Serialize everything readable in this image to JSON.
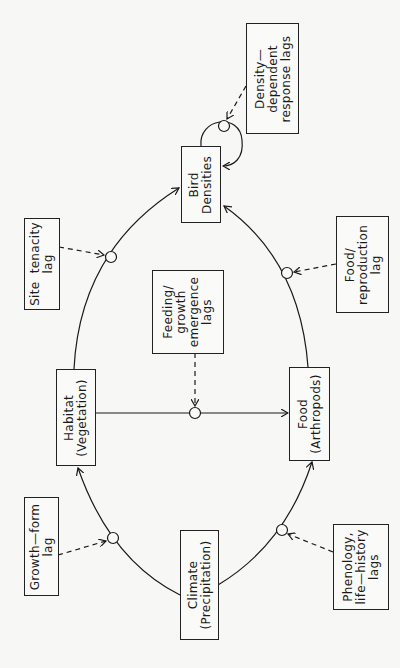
{
  "diagram": {
    "orientation": "rotated-90-ccw",
    "nodes": {
      "bird_densities": {
        "line1": "Bird",
        "line2": "Densities"
      },
      "habitat": {
        "line1": "Habitat",
        "line2": "(Vegetation)"
      },
      "food": {
        "line1": "Food",
        "line2": "(Arthropods)"
      },
      "climate": {
        "line1": "Climate",
        "line2": "(Precipitation)"
      }
    },
    "lags": {
      "density_dependent": {
        "line1": "Density—",
        "line2": "dependent",
        "line3": "response lags"
      },
      "site_tenacity": {
        "line1": "Site  tenacity",
        "line2": "lag"
      },
      "food_reproduction": {
        "line1": "Food/",
        "line2": "reproduction",
        "line3": "lag"
      },
      "feeding_growth": {
        "line1": "Feeding/",
        "line2": "growth",
        "line3": "emergence",
        "line4": "lags"
      },
      "growth_form": {
        "line1": "Growth—form",
        "line2": "lag"
      },
      "phenology": {
        "line1": "Phenology,",
        "line2": "life—history",
        "line3": "lags"
      }
    },
    "edges": [
      {
        "from": "Climate (Precipitation)",
        "to": "Habitat (Vegetation)",
        "lag": "Growth-form lag"
      },
      {
        "from": "Climate (Precipitation)",
        "to": "Food (Arthropods)",
        "lag": "Phenology, life-history lags"
      },
      {
        "from": "Habitat (Vegetation)",
        "to": "Food (Arthropods)",
        "lag": "Feeding/growth emergence lags"
      },
      {
        "from": "Habitat (Vegetation)",
        "to": "Bird Densities",
        "lag": "Site tenacity lag"
      },
      {
        "from": "Food (Arthropods)",
        "to": "Bird Densities",
        "lag": "Food/reproduction lag"
      },
      {
        "from": "Bird Densities",
        "to": "Bird Densities",
        "lag": "Density-dependent response lags"
      }
    ],
    "colors": {
      "line": "#1a1a1a",
      "background": "#f7f7f5"
    }
  }
}
